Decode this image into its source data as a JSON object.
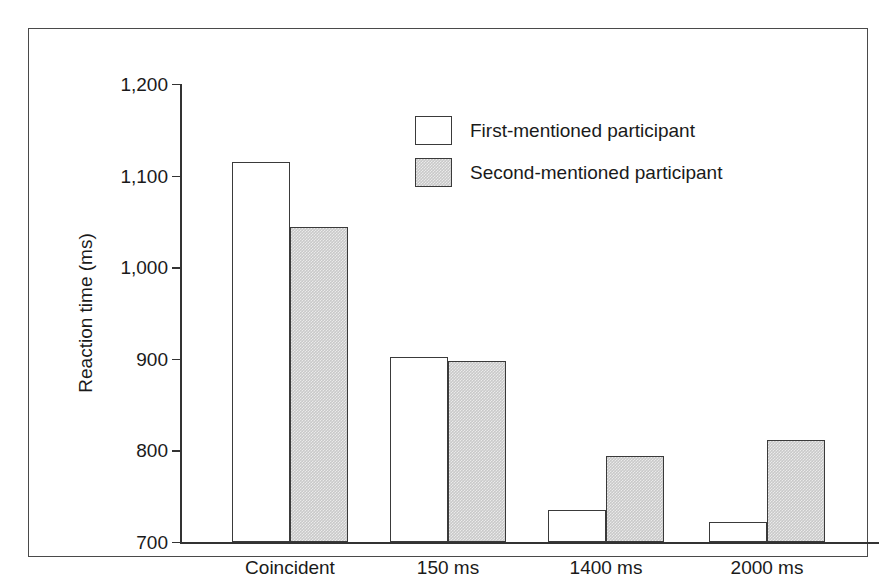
{
  "chart_data": {
    "type": "bar",
    "title": "",
    "subtitle": "",
    "xlabel": "",
    "ylabel": "Reaction time (ms)",
    "categories": [
      "Coincident",
      "150 ms",
      "1400 ms",
      "2000 ms"
    ],
    "series": [
      {
        "name": "First-mentioned participant",
        "color": "#ffffff",
        "edge_color": "#3a3a3a",
        "values": [
          1115,
          902,
          735,
          722
        ]
      },
      {
        "name": "Second-mentioned participant",
        "color": "#c9c9c9",
        "edge_color": "#3a3a3a",
        "values": [
          1044,
          898,
          794,
          811
        ]
      }
    ],
    "yticks": [
      "1,200",
      "1,100",
      "1,000",
      "900",
      "800",
      "700"
    ],
    "ytick_values": [
      1200,
      1100,
      1000,
      900,
      800,
      700
    ],
    "ylim": [
      700,
      1200
    ],
    "grid": false,
    "legend_position": "upper-center"
  },
  "legend": {
    "entries": [
      {
        "label": "First-mentioned participant",
        "swatch": "white-square"
      },
      {
        "label": "Second-mentioned participant",
        "swatch": "gray-square"
      }
    ]
  },
  "axis": {
    "y_title": "Reaction time (ms)"
  },
  "colors": {
    "frame": "#4a4a4a",
    "axis": "#333333",
    "bar_fill_second": "#c9c9c9",
    "bar_edge": "#3a3a3a",
    "background": "#ffffff",
    "text": "#1a1a1a"
  }
}
